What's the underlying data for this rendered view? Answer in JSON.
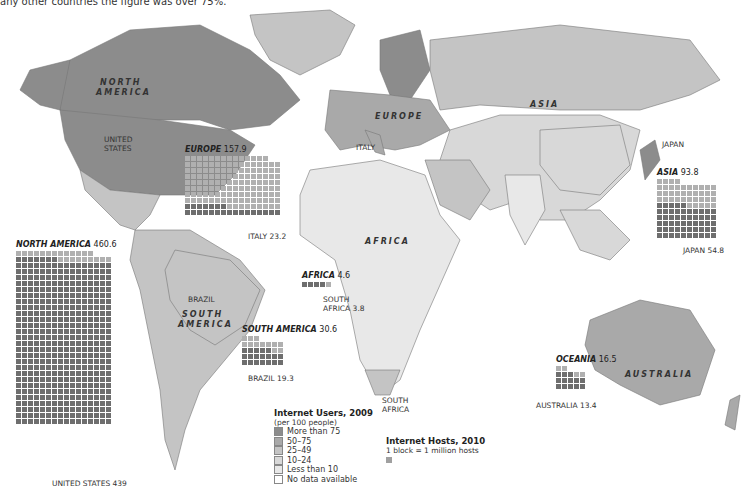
{
  "caption": "any other countries the figure was over 75%.",
  "colors": {
    "more_than_75": "#8c8c8c",
    "50_75": "#a9a9a9",
    "25_49": "#c4c4c4",
    "10_24": "#d8d8d8",
    "less_than_10": "#e8e8e8",
    "no_data": "#ffffff",
    "block_country": "#6e6e6e",
    "block_region": "#b0b0b0"
  },
  "map_labels": {
    "north_america": "NORTH AMERICA",
    "north": "NORTH",
    "america": "AMERICA",
    "united_states": "UNITED STATES",
    "united": "UNITED",
    "states": "STATES",
    "europe": "EUROPE",
    "italy": "ITALY",
    "asia": "ASIA",
    "japan": "JAPAN",
    "africa": "AFRICA",
    "south_africa_1": "SOUTH",
    "south_africa_2": "AFRICA",
    "brazil": "BRAZIL",
    "south": "SOUTH",
    "s_america": "AMERICA",
    "australia": "AUSTRALIA"
  },
  "chart_data": {
    "type": "waffle",
    "title": "Internet Hosts, 2010",
    "unit": "1 block = 1 million hosts",
    "regions": [
      {
        "region": "NORTH AMERICA",
        "total": 460.6,
        "country": "UNITED STATES",
        "country_value": 439
      },
      {
        "region": "EUROPE",
        "total": 157.9,
        "country": "ITALY",
        "country_value": 23.2
      },
      {
        "region": "ASIA",
        "total": 93.8,
        "country": "JAPAN",
        "country_value": 54.8
      },
      {
        "region": "AFRICA",
        "total": 4.6,
        "country": "SOUTH AFRICA",
        "country_value": 3.8
      },
      {
        "region": "SOUTH AMERICA",
        "total": 30.6,
        "country": "BRAZIL",
        "country_value": 19.3
      },
      {
        "region": "OCEANIA",
        "total": 16.5,
        "country": "AUSTRALIA",
        "country_value": 13.4
      }
    ],
    "choropleth": {
      "title": "Internet Users, 2009",
      "subtitle": "(per 100 people)",
      "classes": [
        "More than 75",
        "50–75",
        "25–49",
        "10–24",
        "Less than 10",
        "No data available"
      ]
    }
  },
  "waffles": {
    "na": {
      "region": "NORTH AMERICA",
      "total": "460.6",
      "country_label": "UNITED STATES 439"
    },
    "eu": {
      "region": "EUROPE",
      "total": "157.9",
      "country_label": "ITALY 23.2"
    },
    "as": {
      "region": "ASIA",
      "total": "93.8",
      "country_label": "JAPAN 54.8"
    },
    "af": {
      "region": "AFRICA",
      "total": "4.6",
      "country_label_1": "SOUTH",
      "country_label_2": "AFRICA 3.8"
    },
    "sa": {
      "region": "SOUTH AMERICA",
      "total": "30.6",
      "country_label": "BRAZIL 19.3"
    },
    "oc": {
      "region": "OCEANIA",
      "total": "16.5",
      "country_label": "AUSTRALIA 13.4"
    }
  },
  "legend_users": {
    "title": "Internet Users, 2009",
    "subtitle": "(per 100 people)",
    "items": [
      "More than 75",
      "50–75",
      "25–49",
      "10–24",
      "Less than 10",
      "No data available"
    ]
  },
  "legend_hosts": {
    "title": "Internet Hosts, 2010",
    "subtitle": "1 block = 1 million hosts"
  }
}
